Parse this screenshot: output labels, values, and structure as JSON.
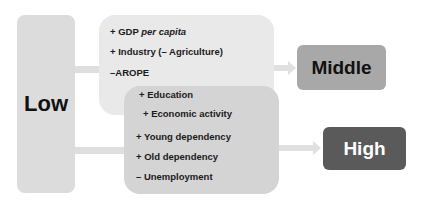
{
  "diagram": {
    "source": {
      "label": "Low"
    },
    "targets": {
      "middle": {
        "label": "Middle"
      },
      "high": {
        "label": "High"
      }
    },
    "groups": {
      "middle_factors": [
        {
          "sign": "+",
          "text": "GDP ",
          "italic": "per capita"
        },
        {
          "sign": "+",
          "text": "Industry (– Agriculture)"
        },
        {
          "sign": "–",
          "text": "AROPE"
        }
      ],
      "high_factors": [
        {
          "sign": "+",
          "text": "Education"
        },
        {
          "sign": "+",
          "text": "Economic activity"
        },
        {
          "sign": "+",
          "text": "Young dependency"
        },
        {
          "sign": "+",
          "text": "Old dependency"
        },
        {
          "sign": "–",
          "text": "Unemployment"
        }
      ]
    },
    "colors": {
      "low_box": "#dcdcdc",
      "middle_group": "#e9e9e9",
      "high_group": "#d4d4d4",
      "middle_box": "#a8a8a8",
      "high_box": "#5a5a5a"
    }
  },
  "labels": {
    "m0": "+ GDP ",
    "m0i": "per capita",
    "m1": "+ Industry (– Agriculture)",
    "m2": "–AROPE",
    "h0": "+ Education",
    "h1": "+ Economic activity",
    "h2": "+ Young dependency",
    "h3": "+ Old dependency",
    "h4": "– Unemployment"
  }
}
